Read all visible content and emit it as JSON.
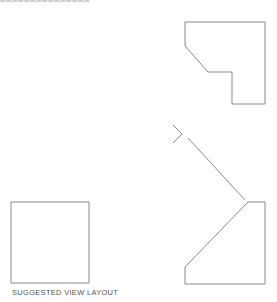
{
  "diagram": {
    "caption": "SUGGESTED VIEW LAYOUT",
    "stroke_color": "#8a8a8a",
    "views": [
      {
        "name": "top-right-view",
        "points": "185,22 265,22 265,104 232,104 232,72 208,72 185,46"
      },
      {
        "name": "bottom-right-view",
        "points": "248,202 265,202 265,284 185,284 185,267"
      },
      {
        "name": "bottom-left-view",
        "points": "11,202 89,202 89,283 11,283"
      }
    ],
    "projection_line": {
      "x1": 188,
      "y1": 138,
      "x2": 245,
      "y2": 200
    },
    "chevron": "173,125 182,134 173,143"
  }
}
